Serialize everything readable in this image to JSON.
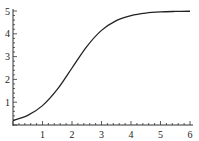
{
  "chart_data": {
    "type": "line",
    "title": "",
    "xlabel": "",
    "ylabel": "",
    "xlim": [
      0,
      6
    ],
    "ylim": [
      0,
      5
    ],
    "grid": false,
    "legend": null,
    "x_ticks": [
      1,
      2,
      3,
      4,
      5,
      6
    ],
    "y_ticks": [
      1,
      2,
      3,
      4,
      5
    ],
    "x_tick_labels": [
      "1",
      "2",
      "3",
      "4",
      "5",
      "6"
    ],
    "y_tick_labels": [
      "1",
      "2",
      "3",
      "4",
      "5"
    ],
    "series": [
      {
        "name": "logistic curve",
        "color": "#222222",
        "x": [
          0,
          0.5,
          1,
          1.5,
          2,
          2.5,
          3,
          3.5,
          4,
          4.5,
          5,
          5.5,
          6
        ],
        "y": [
          0.2,
          0.42,
          0.85,
          1.56,
          2.5,
          3.44,
          4.15,
          4.58,
          4.8,
          4.91,
          4.96,
          4.98,
          4.99
        ]
      }
    ]
  }
}
